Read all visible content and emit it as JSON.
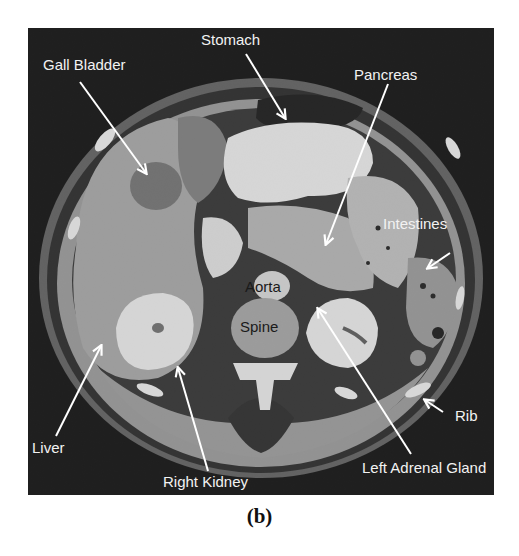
{
  "figure": {
    "caption": "(b)",
    "panel_background": "#000000",
    "label_color": "#f2f2f2",
    "inner_label_color": "#1a1a1a"
  },
  "labels": {
    "gall_bladder": "Gall Bladder",
    "stomach": "Stomach",
    "pancreas": "Pancreas",
    "intestines": "Intestines",
    "aorta": "Aorta",
    "spine": "Spine",
    "liver": "Liver",
    "right_kidney": "Right Kidney",
    "left_adrenal_gland": "Left Adrenal Gland",
    "rib": "Rib"
  }
}
